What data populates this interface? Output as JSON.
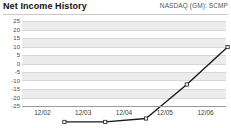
{
  "header": {
    "title": "Net Income History",
    "ticker": "NASDAQ (GM): SCMP"
  },
  "chart_data": {
    "type": "line",
    "title": "Net Income History",
    "subtitle": "NASDAQ (GM): SCMP",
    "xlabel": "",
    "ylabel": "",
    "categories": [
      "12/02",
      "12/03",
      "12/04",
      "12/05",
      "12/06"
    ],
    "values": [
      -22,
      -22,
      -20,
      0,
      22
    ],
    "series": [
      {
        "name": "Net Income",
        "values": [
          -22,
          -22,
          -20,
          0,
          22
        ]
      }
    ],
    "yticks": [
      25,
      20,
      15,
      10,
      5,
      0,
      -5,
      -10,
      -15,
      -20,
      -25
    ],
    "ylim": [
      -25,
      25
    ],
    "grid": true,
    "legend": false,
    "marker": "open-square",
    "line_color": "#1a1a1a",
    "band_color": "#ececec",
    "grid_color": "#d8d8d8"
  },
  "axis": {
    "y_tick_labels": [
      "25",
      "20",
      "15",
      "10",
      "5",
      "0",
      "-5",
      "-10",
      "-15",
      "-20",
      "-25"
    ],
    "x_tick_labels": [
      "12/02",
      "12/03",
      "12/04",
      "12/05",
      "12/06"
    ]
  }
}
